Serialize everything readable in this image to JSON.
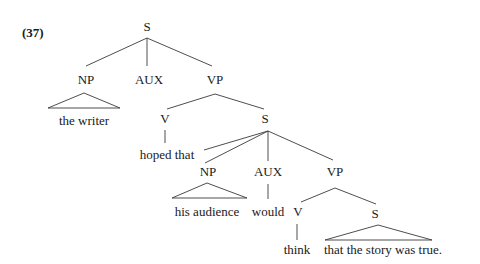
{
  "example_number": "(37)",
  "tree": {
    "root": "S",
    "nodes": {
      "s_root": "S",
      "np_subject": "NP",
      "aux_root": "AUX",
      "vp_root": "VP",
      "np_subject_text": "the writer",
      "v_main": "V",
      "v_main_text": "hoped that",
      "s_embedded": "S",
      "np_embedded": "NP",
      "np_embedded_text": "his audience",
      "aux_embedded": "AUX",
      "aux_embedded_text": "would",
      "vp_embedded": "VP",
      "v_embedded": "V",
      "v_embedded_text": "think",
      "s_innermost": "S",
      "s_innermost_text": "that the story was true."
    }
  },
  "colors": {
    "line": "#3a3a3a",
    "text": "#1a1a1a"
  }
}
